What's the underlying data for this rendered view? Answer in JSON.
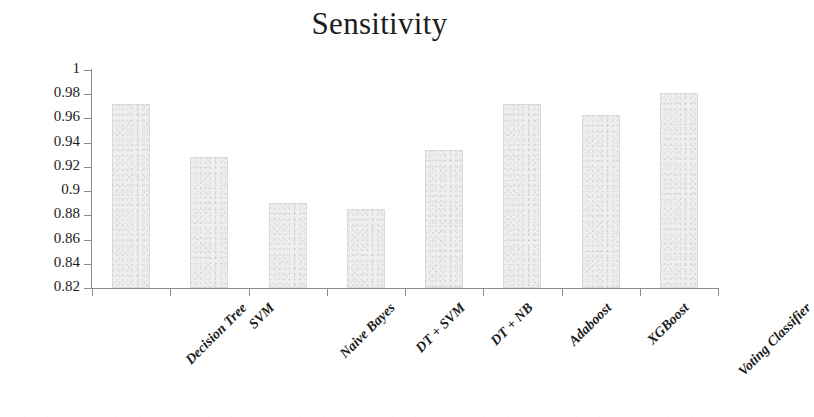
{
  "chart_data": {
    "type": "bar",
    "title": "Sensitivity",
    "xlabel": "",
    "ylabel": "",
    "categories": [
      "Decision Tree",
      "SVM",
      "Naive Bayes",
      "DT + SVM",
      "DT + NB",
      "Adaboost",
      "XGBoost",
      "Voting Classifier"
    ],
    "values": [
      0.972,
      0.928,
      0.89,
      0.885,
      0.934,
      0.972,
      0.963,
      0.981
    ],
    "ylim": [
      0.82,
      1.0
    ],
    "yticks": [
      0.82,
      0.84,
      0.86,
      0.88,
      0.9,
      0.92,
      0.94,
      0.96,
      0.98,
      1
    ],
    "ytick_labels": [
      "0.82",
      "0.84",
      "0.86",
      "0.88",
      "0.9",
      "0.92",
      "0.94",
      "0.96",
      "0.98",
      "1"
    ],
    "grid": false,
    "legend": null,
    "legend_position": "none",
    "bar_color": "#eeeeee",
    "axis_color": "#8c8c8c",
    "text_color": "#1c1c1c",
    "background": "#ffffff"
  }
}
